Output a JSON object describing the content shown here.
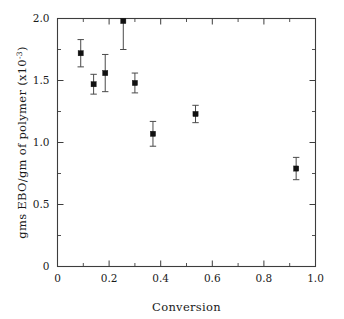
{
  "chart_data": {
    "type": "scatter",
    "title": "",
    "xlabel": "Conversion",
    "ylabel": "gms EBO/gm of polymer (x10",
    "ylabel_sup": "-3",
    "ylabel_tail": ")",
    "xlim": [
      0,
      1.0
    ],
    "ylim": [
      0,
      2.0
    ],
    "grid": false,
    "legend": null,
    "xticks": [
      0,
      0.2,
      0.4,
      0.6,
      0.8,
      1.0
    ],
    "xtick_labels": [
      "0",
      "0.2",
      "0.4",
      "0.6",
      "0.8",
      "1.0"
    ],
    "yticks": [
      0,
      0.5,
      1.0,
      1.5,
      2.0
    ],
    "ytick_labels": [
      "0",
      "0.5",
      "1.0",
      "1.5",
      "2.0"
    ],
    "x_minor_ticks": [
      0.1,
      0.3,
      0.5,
      0.7,
      0.9
    ],
    "y_minor_ticks": [
      0.25,
      0.75,
      1.25,
      1.75
    ],
    "marker_style": "filled-square",
    "marker_color": "#111111",
    "errorbar_color": "#4a4a4a",
    "axis_color": "#3d3d3d",
    "series": [
      {
        "name": "EBO per gram of polymer",
        "x": [
          0.09,
          0.14,
          0.185,
          0.255,
          0.3,
          0.37,
          0.535,
          0.925
        ],
        "y": [
          1.72,
          1.47,
          1.56,
          1.98,
          1.48,
          1.07,
          1.23,
          0.79
        ],
        "yerr": [
          0.11,
          0.08,
          0.15,
          0.23,
          0.08,
          0.1,
          0.07,
          0.09
        ]
      }
    ]
  },
  "figure": {
    "caption": "",
    "background": "#ffffff"
  }
}
